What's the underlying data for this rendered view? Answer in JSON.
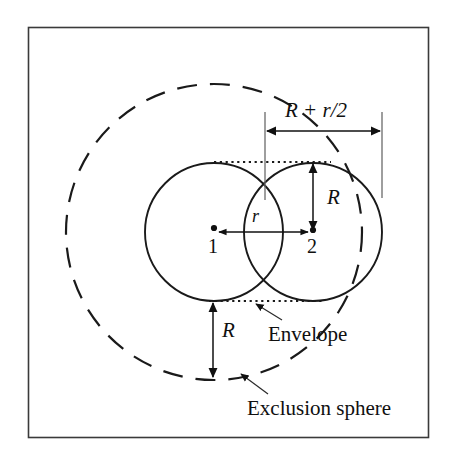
{
  "figure": {
    "type": "geometry-diagram",
    "background_color": "#ffffff",
    "ink_color": "#101010",
    "frame": {
      "name": "figure-border",
      "x": 28,
      "y": 27,
      "width": 400,
      "height": 410,
      "stroke_color": "#3a3a3a"
    },
    "labels": {
      "dimension_top": "R + r/2",
      "radius_right": "R",
      "radius_bottom": "R",
      "separation": "r",
      "center_one": "1",
      "center_two": "2",
      "envelope": "Envelope",
      "exclusion_sphere": "Exclusion sphere"
    },
    "geometry": {
      "circle_one": {
        "cx": 214,
        "cy": 232,
        "r": 69,
        "style": "solid"
      },
      "circle_two": {
        "cx": 313,
        "cy": 232,
        "r": 69,
        "style": "solid"
      },
      "exclusion_sphere": {
        "cx": 214,
        "cy": 232,
        "r": 148,
        "style": "dashed"
      },
      "center_dot_one": {
        "cx": 214,
        "cy": 232,
        "r": 3
      },
      "center_dot_two": {
        "cx": 313,
        "cy": 232,
        "r": 3
      },
      "dotted_line_top": {
        "x1": 214,
        "y1": 162,
        "x2": 331,
        "y2": 162
      },
      "dotted_line_bottom": {
        "x1": 209,
        "y1": 301,
        "x2": 322,
        "y2": 301
      },
      "dimension_arrow_top": {
        "x1": 265,
        "y1": 131,
        "x2": 382,
        "y2": 131
      },
      "tick_left": {
        "x": 265,
        "y1": 112,
        "y2": 200
      },
      "tick_right": {
        "x": 382,
        "y1": 112,
        "y2": 198
      },
      "arrow_radius_right": {
        "x": 313,
        "y1": 163,
        "y2": 231
      },
      "arrow_radius_bottom": {
        "x": 213,
        "y1": 302,
        "y2": 378
      },
      "arrow_separation": {
        "x1": 215,
        "y1": 232,
        "x2": 312,
        "y2": 232
      },
      "leader_envelope": {
        "x1": 280,
        "y1": 318,
        "x2": 254,
        "y2": 303
      },
      "leader_exclusion": {
        "x1": 267,
        "y1": 392,
        "x2": 239,
        "y2": 373
      }
    }
  }
}
